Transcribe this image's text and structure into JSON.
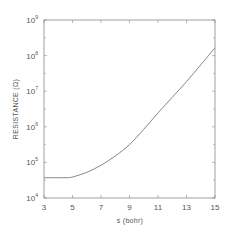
{
  "chart_data": {
    "type": "line",
    "title": "",
    "xlabel": "s (bohr)",
    "ylabel": "RESISTANCE (Ω)",
    "xlim": [
      3,
      15
    ],
    "ylim": [
      10000,
      1000000000
    ],
    "yscale": "log",
    "grid": false,
    "x_ticks": [
      3,
      5,
      7,
      9,
      11,
      13,
      15
    ],
    "x_tick_labels": [
      "3",
      "5",
      "7",
      "9",
      "11",
      "13",
      "15"
    ],
    "y_ticks": [
      10000,
      100000,
      1000000,
      10000000,
      100000000,
      1000000000
    ],
    "y_tick_labels": [
      {
        "base": "10",
        "exp": "4"
      },
      {
        "base": "10",
        "exp": "5"
      },
      {
        "base": "10",
        "exp": "6"
      },
      {
        "base": "10",
        "exp": "7"
      },
      {
        "base": "10",
        "exp": "8"
      },
      {
        "base": "10",
        "exp": "9"
      }
    ],
    "series": [
      {
        "name": "resistance",
        "x": [
          3,
          4,
          4.6,
          5,
          6,
          7,
          8,
          9,
          10,
          11,
          12,
          13,
          14,
          15
        ],
        "log10_values": [
          4.57,
          4.57,
          4.57,
          4.59,
          4.72,
          4.92,
          5.18,
          5.5,
          5.93,
          6.39,
          6.83,
          7.27,
          7.74,
          8.22
        ]
      }
    ],
    "colors": {
      "axis": "#888888",
      "line": "#777777",
      "text": "#555555"
    }
  }
}
